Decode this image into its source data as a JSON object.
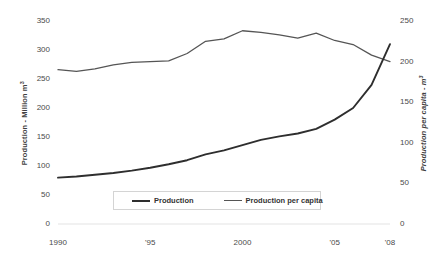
{
  "chart_data": {
    "type": "line",
    "title": "",
    "xlabel": "",
    "ylabel": "Production - Million m³",
    "y2label": "Production per capita - m³",
    "x": [
      1990,
      1991,
      1992,
      1993,
      1994,
      1995,
      1996,
      1997,
      1998,
      1999,
      2000,
      2001,
      2002,
      2003,
      2004,
      2005,
      2006,
      2007,
      2008
    ],
    "xtick_labels": [
      "1990",
      "'95",
      "2000",
      "'05",
      "'08"
    ],
    "xtick_values": [
      1990,
      1995,
      2000,
      2005,
      2008
    ],
    "ylim": [
      0,
      350
    ],
    "ytick_values": [
      0,
      50,
      100,
      150,
      200,
      250,
      300,
      350
    ],
    "ytick_labels": [
      "0",
      "50",
      "100",
      "150",
      "200",
      "250",
      "300",
      "350"
    ],
    "y2lim": [
      0,
      250
    ],
    "y2tick_values": [
      0,
      50,
      100,
      150,
      200,
      250
    ],
    "y2tick_labels": [
      "0",
      "50",
      "100",
      "150",
      "200",
      "250"
    ],
    "grid": false,
    "legend_position": "inside-bottom-center",
    "series": [
      {
        "name": "Production",
        "axis": "left",
        "color": "#2e2e2e",
        "line_width": 1.9,
        "values": [
          80,
          82,
          85,
          88,
          92,
          97,
          103,
          110,
          120,
          127,
          136,
          145,
          151,
          156,
          164,
          180,
          200,
          240,
          310
        ]
      },
      {
        "name": "Production per capita",
        "axis": "right",
        "color": "#555555",
        "line_width": 1.3,
        "values": [
          190,
          188,
          191,
          196,
          199,
          200,
          201,
          210,
          225,
          228,
          238,
          236,
          233,
          229,
          235,
          226,
          221,
          208,
          200
        ]
      }
    ]
  },
  "axes": {
    "left_title": "Production - Million m",
    "left_title_sup": "3",
    "right_title": "Production per capita - m",
    "right_title_sup": "3"
  },
  "legend": {
    "items": [
      {
        "label": "Production"
      },
      {
        "label": "Production per capita"
      }
    ]
  }
}
